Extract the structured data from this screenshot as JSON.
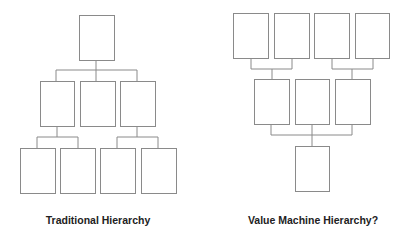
{
  "diagrams": [
    {
      "id": "left",
      "title": "Traditional Hierarchy",
      "boxes": [
        {
          "x": 79,
          "y": 15,
          "w": 35,
          "h": 45
        },
        {
          "x": 40,
          "y": 81,
          "w": 34,
          "h": 45
        },
        {
          "x": 80,
          "y": 81,
          "w": 35,
          "h": 45
        },
        {
          "x": 120,
          "y": 81,
          "w": 35,
          "h": 45
        },
        {
          "x": 20,
          "y": 148,
          "w": 35,
          "h": 45
        },
        {
          "x": 60,
          "y": 148,
          "w": 35,
          "h": 45
        },
        {
          "x": 100,
          "y": 148,
          "w": 35,
          "h": 45
        },
        {
          "x": 141,
          "y": 148,
          "w": 35,
          "h": 45
        }
      ],
      "lines": [
        [
          96,
          60,
          96,
          70
        ],
        [
          56,
          70,
          137,
          70
        ],
        [
          56,
          70,
          56,
          81
        ],
        [
          96,
          70,
          96,
          81
        ],
        [
          137,
          70,
          137,
          81
        ],
        [
          57,
          126,
          57,
          137
        ],
        [
          37,
          137,
          78,
          137
        ],
        [
          37,
          137,
          37,
          148
        ],
        [
          78,
          137,
          78,
          148
        ],
        [
          137,
          126,
          137,
          137
        ],
        [
          117,
          137,
          158,
          137
        ],
        [
          117,
          137,
          117,
          148
        ],
        [
          158,
          137,
          158,
          148
        ]
      ]
    },
    {
      "id": "right",
      "title": "Value Machine Hierarchy?",
      "boxes": [
        {
          "x": 233,
          "y": 13,
          "w": 35,
          "h": 45
        },
        {
          "x": 274,
          "y": 13,
          "w": 35,
          "h": 45
        },
        {
          "x": 314,
          "y": 13,
          "w": 35,
          "h": 45
        },
        {
          "x": 355,
          "y": 13,
          "w": 34,
          "h": 45
        },
        {
          "x": 254,
          "y": 79,
          "w": 35,
          "h": 45
        },
        {
          "x": 295,
          "y": 79,
          "w": 34,
          "h": 45
        },
        {
          "x": 335,
          "y": 79,
          "w": 35,
          "h": 45
        },
        {
          "x": 295,
          "y": 146,
          "w": 34,
          "h": 45
        }
      ],
      "lines": [
        [
          251,
          58,
          251,
          69
        ],
        [
          292,
          58,
          292,
          69
        ],
        [
          251,
          69,
          292,
          69
        ],
        [
          272,
          69,
          272,
          79
        ],
        [
          332,
          58,
          332,
          69
        ],
        [
          373,
          58,
          373,
          69
        ],
        [
          332,
          69,
          373,
          69
        ],
        [
          352,
          69,
          352,
          79
        ],
        [
          271,
          124,
          271,
          135
        ],
        [
          352,
          124,
          352,
          135
        ],
        [
          271,
          135,
          352,
          135
        ],
        [
          312,
          124,
          312,
          146
        ]
      ]
    }
  ],
  "colors": {
    "stroke": "#8a8a8a",
    "text": "#222222",
    "background": "#ffffff"
  }
}
